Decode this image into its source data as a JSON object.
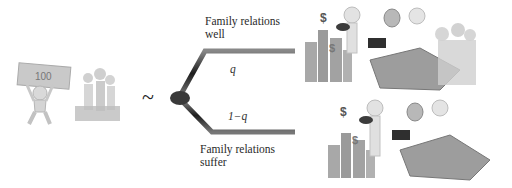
{
  "diagram": {
    "relation_symbol": "~",
    "branches": [
      {
        "label_line1": "Family relations",
        "label_line2": "well",
        "probability": "q",
        "outcome": "rich-successful-family-illustration"
      },
      {
        "label_line1": "Family relations",
        "label_line2": "suffer",
        "probability": "1−q",
        "outcome": "rich-successful-alone-illustration"
      }
    ],
    "left_icons": [
      "man-lifting-banknote-icon",
      "family-with-money-icon"
    ],
    "colors": {
      "branch": "#2b2b2b",
      "node": "#333333",
      "illustration": "#9a9a9a"
    },
    "dollar": "$"
  }
}
